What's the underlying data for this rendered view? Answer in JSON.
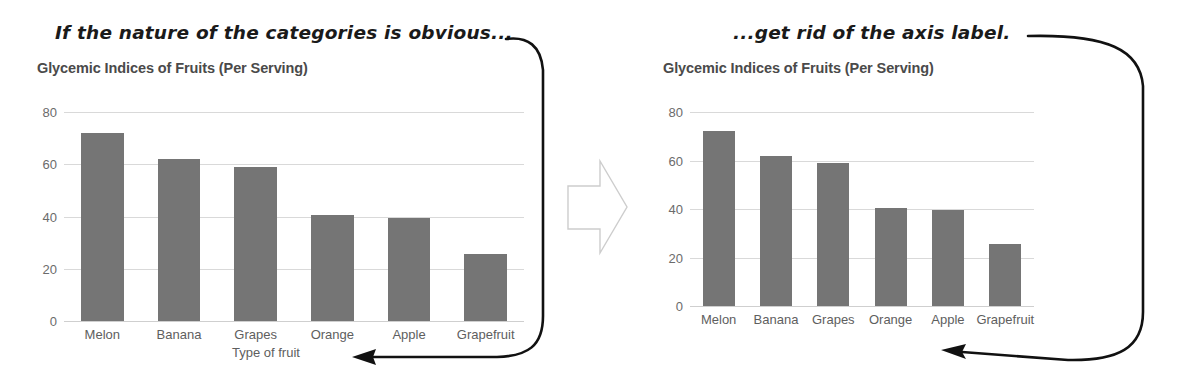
{
  "annotations": {
    "left": "If the nature of the categories is obvious...",
    "right": "...get rid of the axis label."
  },
  "icons": {
    "transition_arrow": "right-block-arrow-icon",
    "pointer_left": "curved-pointer-arrow-icon",
    "pointer_right": "curved-pointer-arrow-icon"
  },
  "charts": [
    {
      "id": "before",
      "title": "Glycemic Indices of Fruits (Per Serving)",
      "xlabel": "Type of fruit",
      "show_xlabel": true
    },
    {
      "id": "after",
      "title": "Glycemic Indices of Fruits (Per Serving)",
      "xlabel": "",
      "show_xlabel": false
    }
  ],
  "chart_data": [
    {
      "type": "bar",
      "title": "Glycemic Indices of Fruits (Per Serving)",
      "xlabel": "Type of fruit",
      "ylabel": "",
      "categories": [
        "Melon",
        "Banana",
        "Grapes",
        "Orange",
        "Apple",
        "Grapefruit"
      ],
      "values": [
        72,
        62,
        59,
        40.5,
        39.5,
        25.5
      ],
      "yticks": [
        0,
        20,
        40,
        60,
        80
      ],
      "ylim": [
        0,
        80
      ],
      "grid": true,
      "legend": false,
      "bar_color": "#757575",
      "grid_color": "#d9d9d9"
    },
    {
      "type": "bar",
      "title": "Glycemic Indices of Fruits (Per Serving)",
      "xlabel": "",
      "ylabel": "",
      "categories": [
        "Melon",
        "Banana",
        "Grapes",
        "Orange",
        "Apple",
        "Grapefruit"
      ],
      "values": [
        72,
        62,
        59,
        40.5,
        39.5,
        25.5
      ],
      "yticks": [
        0,
        20,
        40,
        60,
        80
      ],
      "ylim": [
        0,
        80
      ],
      "grid": true,
      "legend": false,
      "bar_color": "#757575",
      "grid_color": "#d9d9d9"
    }
  ]
}
